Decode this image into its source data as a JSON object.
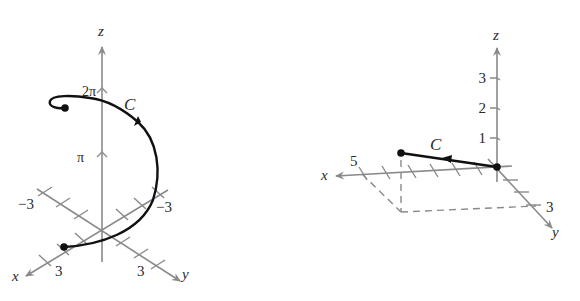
{
  "figures": [
    {
      "id": "helix",
      "axes": {
        "x_label": "x",
        "y_label": "y",
        "z_label": "z"
      },
      "z_ticks": [
        "π",
        "2π"
      ],
      "x_ticks": [
        "3",
        "−3"
      ],
      "y_ticks": [
        "3",
        "−3"
      ],
      "curve_label": "C",
      "colors": {
        "axis": "#8a8a8a",
        "curve": "#111111"
      }
    },
    {
      "id": "line-segment",
      "axes": {
        "x_label": "x",
        "y_label": "y",
        "z_label": "z"
      },
      "z_ticks": [
        "1",
        "2",
        "3"
      ],
      "x_ticks": [
        "5"
      ],
      "y_ticks": [
        "3"
      ],
      "curve_label": "C",
      "colors": {
        "axis": "#8a8a8a",
        "curve": "#111111"
      }
    }
  ]
}
